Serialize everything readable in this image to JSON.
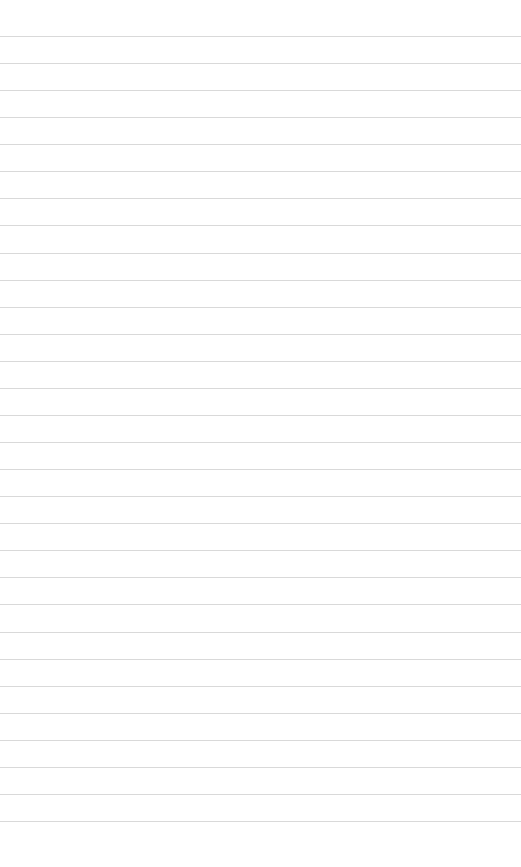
{
  "page": {
    "type": "lined-paper",
    "background_color": "#ffffff",
    "line_color": "#d9d9d9",
    "line_count": 30,
    "first_line_y": 36,
    "line_spacing": 27.07
  }
}
